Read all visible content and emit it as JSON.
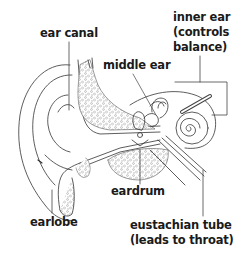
{
  "diagram": {
    "type": "anatomical illustration",
    "line_color": "#333333",
    "text_color": "#1a1a1a",
    "background": "#ffffff"
  },
  "labels": {
    "ear_canal": "ear canal",
    "inner_ear_line1": "inner ear",
    "inner_ear_line2": "(controls",
    "inner_ear_line3": "balance)",
    "middle_ear": "middle ear",
    "eardrum": "eardrum",
    "earlobe": "earlobe",
    "eustachian_line1": "eustachian tube",
    "eustachian_line2": "(leads to throat)"
  }
}
